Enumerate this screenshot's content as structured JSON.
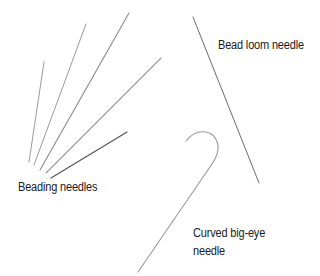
{
  "labels": {
    "beading": "Beading needles",
    "loom": "Bead loom needle",
    "curved_line1": "Curved big-eye",
    "curved_line2": "needle"
  },
  "colors": {
    "background": "#ffffff",
    "needle": "#8a8a8a",
    "needle_dark": "#555555",
    "text": "#1a1a1a"
  }
}
